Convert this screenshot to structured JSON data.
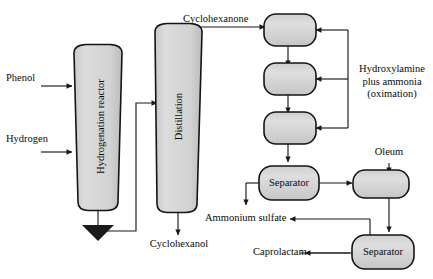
{
  "diagram": {
    "type": "process-flow-diagram",
    "background_color": "#ffffff",
    "line_color": "#1a1a1a",
    "vessel_fill": "#d4d4d4",
    "vessel_stroke": "#141414"
  },
  "units": {
    "hydrogenation_reactor": "Hydrogenation reactor",
    "distillation": "Distillation",
    "separator_one": "Separator",
    "separator_two": "Separator",
    "oximation_reactor_one": "",
    "oximation_reactor_two": "",
    "oximation_reactor_three": "",
    "rearrangement_reactor": ""
  },
  "streams": {
    "phenol": "Phenol",
    "hydrogen": "Hydrogen",
    "cyclohexanone": "Cyclohexanone",
    "cyclohexanol": "Cyclohexanol",
    "hydroxylamine": "Hydroxylamine\nplus ammonia\n(oximation)",
    "hydroxylamine_line1": "Hydroxylamine",
    "hydroxylamine_line2": "plus ammonia",
    "hydroxylamine_line3": "(oximation)",
    "oleum": "Oleum",
    "ammonium_sulfate": "Ammonium sulfate",
    "caprolactam": "Caprolactam"
  }
}
